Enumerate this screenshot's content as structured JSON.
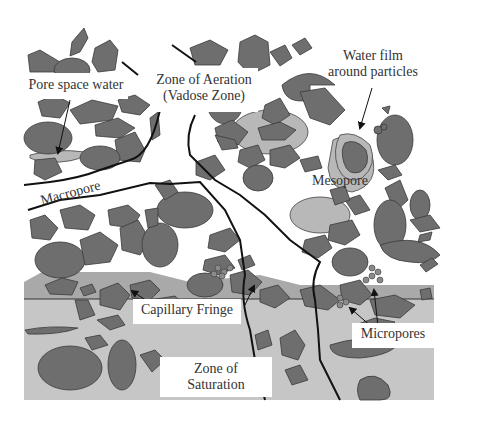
{
  "diagram": {
    "colors": {
      "particle": "#6e6e6e",
      "particle_stroke": "#3a3a3a",
      "water": "#b8b8b8",
      "capillary_fringe": "#a9a9a9",
      "saturation": "#c6c6c6",
      "boundary": "#111111",
      "background": "#ffffff"
    },
    "labels": {
      "pore_space_water": "Pore space water",
      "zone_aeration_line1": "Zone of Aeration",
      "zone_aeration_line2": "(Vadose Zone)",
      "water_film_line1": "Water film",
      "water_film_line2": "around particles",
      "macropore": "Macropore",
      "mesopore": "Mesopore",
      "capillary_fringe": "Capillary Fringe",
      "micropores": "Micropores",
      "zone_saturation_line1": "Zone of",
      "zone_saturation_line2": "Saturation"
    }
  }
}
